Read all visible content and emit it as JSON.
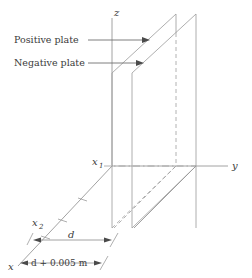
{
  "figure": {
    "background_color": "#ffffff",
    "line_color": "#8a8a8a",
    "text_color": "#3a3a3a"
  },
  "axes": {
    "z_label": "z",
    "y_label": "y",
    "x_label": "x"
  },
  "annotations": {
    "positive_plate_label": "Positive plate",
    "negative_plate_label": "Negative plate"
  },
  "markers": {
    "x1_symbol": "x",
    "x1_subscript": "1",
    "x2_symbol": "x",
    "x2_subscript": "2"
  },
  "dimensions": {
    "inner_label": "d",
    "outer_label": "d + 0.005 m"
  }
}
